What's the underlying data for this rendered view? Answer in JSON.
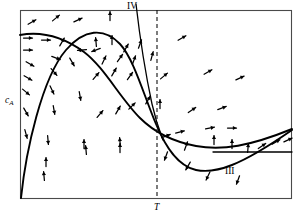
{
  "figure": {
    "kind": "phase-plane-vector-field",
    "background": "#ffffff",
    "line_color": "#000000",
    "frame_color": "#4a4a4a",
    "labels": {
      "y_axis": "c",
      "y_axis_sub": "A",
      "x_axis_tick": "T",
      "branch_four": "IV",
      "branch_three": "III"
    }
  },
  "chart_data": {
    "type": "line",
    "title": "",
    "xlabel": "T",
    "ylabel": "cA",
    "grid": false,
    "legend": null,
    "axis_box": {
      "x0": 20,
      "y0": 10,
      "x1": 292,
      "y1": 198
    },
    "annotations": [
      {
        "text": "c",
        "sub": "A",
        "x": 8,
        "y": 100,
        "role": "y-axis-label"
      },
      {
        "text": "T",
        "x": 158,
        "y": 209,
        "role": "x-tick-label"
      },
      {
        "text": "IV",
        "x": 128,
        "y": 9,
        "role": "branch-label"
      },
      {
        "text": "III",
        "x": 228,
        "y": 172,
        "role": "branch-label"
      }
    ],
    "series": [
      {
        "name": "upper-sigmoid-curve",
        "style": "solid-bold",
        "path": "M20,35 C42,31 62,36 84,52 C104,67 120,98 140,118 C156,134 175,142 196,146 C222,151 250,146 292,129"
      },
      {
        "name": "hill-then-valley-curve",
        "style": "solid-bold",
        "path": "M21,198 C26,150 42,78 66,50 C84,29 104,27 120,44 C134,59 144,96 156,124 C166,148 178,166 196,170 C216,174 240,166 292,130"
      },
      {
        "name": "branch-iv-line",
        "style": "solid-thin",
        "path": "M136,4 C139,30 146,76 152,104 C156,122 160,132 163,140"
      },
      {
        "name": "vertical-dashed-T",
        "style": "dashed",
        "path": "M157,10 L157,198"
      },
      {
        "name": "horizontal-branch-iii",
        "style": "solid-thin",
        "path": "M213,152 L292,152"
      }
    ],
    "vector_field": {
      "description": "small directional arrows indicating trajectory slopes",
      "arrows": [
        {
          "x": 32,
          "y": 22,
          "angle": 30
        },
        {
          "x": 56,
          "y": 18,
          "angle": 40
        },
        {
          "x": 78,
          "y": 20,
          "angle": 25
        },
        {
          "x": 110,
          "y": 16,
          "angle": 90
        },
        {
          "x": 28,
          "y": 38,
          "angle": 0
        },
        {
          "x": 46,
          "y": 40,
          "angle": 0
        },
        {
          "x": 28,
          "y": 50,
          "angle": 0
        },
        {
          "x": 62,
          "y": 42,
          "angle": 60
        },
        {
          "x": 96,
          "y": 42,
          "angle": 95
        },
        {
          "x": 112,
          "y": 40,
          "angle": 90
        },
        {
          "x": 30,
          "y": 64,
          "angle": 330
        },
        {
          "x": 56,
          "y": 58,
          "angle": 340
        },
        {
          "x": 82,
          "y": 50,
          "angle": 185
        },
        {
          "x": 96,
          "y": 50,
          "angle": 200
        },
        {
          "x": 126,
          "y": 48,
          "angle": 60
        },
        {
          "x": 140,
          "y": 44,
          "angle": 70
        },
        {
          "x": 28,
          "y": 78,
          "angle": 330
        },
        {
          "x": 54,
          "y": 72,
          "angle": 310
        },
        {
          "x": 72,
          "y": 62,
          "angle": 300
        },
        {
          "x": 104,
          "y": 60,
          "angle": 65
        },
        {
          "x": 120,
          "y": 58,
          "angle": 55
        },
        {
          "x": 134,
          "y": 60,
          "angle": 70
        },
        {
          "x": 152,
          "y": 56,
          "angle": 75
        },
        {
          "x": 182,
          "y": 38,
          "angle": 30
        },
        {
          "x": 26,
          "y": 92,
          "angle": 320
        },
        {
          "x": 52,
          "y": 90,
          "angle": 295
        },
        {
          "x": 80,
          "y": 96,
          "angle": 280
        },
        {
          "x": 96,
          "y": 76,
          "angle": 50
        },
        {
          "x": 114,
          "y": 72,
          "angle": 60
        },
        {
          "x": 130,
          "y": 76,
          "angle": 55
        },
        {
          "x": 164,
          "y": 76,
          "angle": 40
        },
        {
          "x": 208,
          "y": 72,
          "angle": 30
        },
        {
          "x": 240,
          "y": 78,
          "angle": 25
        },
        {
          "x": 26,
          "y": 112,
          "angle": 300
        },
        {
          "x": 54,
          "y": 110,
          "angle": 280
        },
        {
          "x": 100,
          "y": 114,
          "angle": 50
        },
        {
          "x": 118,
          "y": 110,
          "angle": 60
        },
        {
          "x": 132,
          "y": 106,
          "angle": 45
        },
        {
          "x": 148,
          "y": 100,
          "angle": 60
        },
        {
          "x": 160,
          "y": 104,
          "angle": 90
        },
        {
          "x": 192,
          "y": 110,
          "angle": 35
        },
        {
          "x": 222,
          "y": 108,
          "angle": 20
        },
        {
          "x": 26,
          "y": 134,
          "angle": 285
        },
        {
          "x": 48,
          "y": 140,
          "angle": 275
        },
        {
          "x": 84,
          "y": 144,
          "angle": 90
        },
        {
          "x": 120,
          "y": 142,
          "angle": 95
        },
        {
          "x": 166,
          "y": 136,
          "angle": 20
        },
        {
          "x": 180,
          "y": 132,
          "angle": 15
        },
        {
          "x": 210,
          "y": 128,
          "angle": 10
        },
        {
          "x": 232,
          "y": 128,
          "angle": 0
        },
        {
          "x": 46,
          "y": 162,
          "angle": 90
        },
        {
          "x": 86,
          "y": 150,
          "angle": 95
        },
        {
          "x": 120,
          "y": 148,
          "angle": 90
        },
        {
          "x": 166,
          "y": 156,
          "angle": 250
        },
        {
          "x": 186,
          "y": 146,
          "angle": 70
        },
        {
          "x": 214,
          "y": 140,
          "angle": 90
        },
        {
          "x": 232,
          "y": 144,
          "angle": 90
        },
        {
          "x": 248,
          "y": 148,
          "angle": 85
        },
        {
          "x": 262,
          "y": 146,
          "angle": 35
        },
        {
          "x": 276,
          "y": 142,
          "angle": 30
        },
        {
          "x": 288,
          "y": 140,
          "angle": 25
        },
        {
          "x": 44,
          "y": 176,
          "angle": 95
        },
        {
          "x": 188,
          "y": 166,
          "angle": 240
        },
        {
          "x": 208,
          "y": 176,
          "angle": 245
        },
        {
          "x": 238,
          "y": 180,
          "angle": 250
        }
      ]
    }
  }
}
